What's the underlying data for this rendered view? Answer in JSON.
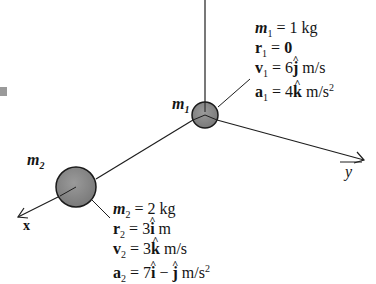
{
  "diagram": {
    "type": "particle-system",
    "axes": {
      "x_label": "x",
      "y_label": "y",
      "z_label": ""
    },
    "mass1": {
      "label_sym": "m",
      "label_sub": "1",
      "rows": [
        {
          "sym": "m",
          "sub": "1",
          "eq": " = ",
          "val": "1 kg",
          "bold": false,
          "hat": "",
          "unit": "",
          "sup": ""
        },
        {
          "sym": "r",
          "sub": "1",
          "eq": " = ",
          "val": "0",
          "bold": true,
          "hat": "",
          "unit": "",
          "sup": ""
        },
        {
          "sym": "v",
          "sub": "1",
          "eq": " = ",
          "val": "6",
          "bold": true,
          "hat": "j",
          "unit": " m/s",
          "sup": ""
        },
        {
          "sym": "a",
          "sub": "1",
          "eq": " = ",
          "val": "4",
          "bold": true,
          "hat": "k",
          "unit": " m/s",
          "sup": "2"
        }
      ]
    },
    "mass2": {
      "label_sym": "m",
      "label_sub": "2",
      "rows": [
        {
          "sym": "m",
          "sub": "2",
          "eq": " = ",
          "val": "2 kg"
        },
        {
          "sym": "r",
          "sub": "2",
          "eq": " = ",
          "val": "3",
          "hat": "i",
          "unit": " m"
        },
        {
          "sym": "v",
          "sub": "2",
          "eq": " = ",
          "val": "3",
          "hat": "k",
          "unit": " m/s"
        },
        {
          "sym": "a",
          "sub": "2",
          "eq": " = ",
          "val": "7",
          "hat": "i",
          "minus": " − ",
          "hat2": "j",
          "unit": " m/s",
          "sup": "2"
        }
      ]
    },
    "colors": {
      "line": "#1e1e1e",
      "sphere_fill": "#8a8a8a",
      "sphere_stroke": "#1a1a1a",
      "background": "#ffffff"
    }
  }
}
